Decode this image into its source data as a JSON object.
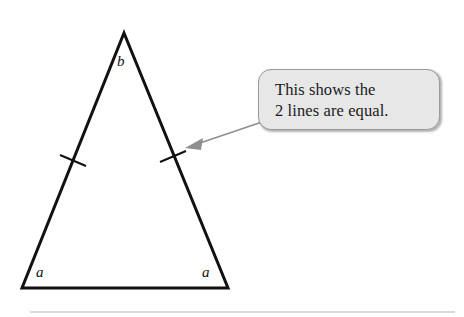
{
  "figure": {
    "type": "isosceles-triangle-diagram",
    "background_color": "#ffffff",
    "stroke_color": "#111111",
    "triangle": {
      "apex": {
        "x": 124,
        "y": 33
      },
      "bottom_left": {
        "x": 22,
        "y": 288
      },
      "bottom_right": {
        "x": 228,
        "y": 288
      },
      "stroke_width": 3
    },
    "tick_marks": [
      {
        "name": "left-leg-tick",
        "x": 72,
        "y": 160
      },
      {
        "name": "right-leg-tick",
        "x": 172,
        "y": 157
      }
    ],
    "labels": {
      "apex_angle": "b",
      "base_angle_left": "a",
      "base_angle_right": "a"
    }
  },
  "callout": {
    "line1": "This shows the",
    "line2": "2 lines are equal.",
    "fill_color": "#e7e7e7",
    "border_color": "#9a9a9a"
  },
  "arrow": {
    "color": "#8f8f8f",
    "tail": {
      "x": 262,
      "y": 122
    },
    "head": {
      "x": 186,
      "y": 148
    }
  },
  "footer_rule": {
    "color": "#cfcfcf",
    "y": 312
  }
}
